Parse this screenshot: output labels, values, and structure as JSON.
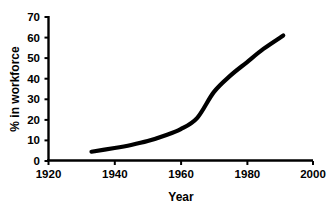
{
  "chart_data": {
    "type": "line",
    "title": "",
    "xlabel": "Year",
    "ylabel": "% in workforce",
    "xlim": [
      1920,
      2000
    ],
    "ylim": [
      0,
      70
    ],
    "xticks": [
      1920,
      1940,
      1960,
      1980,
      2000
    ],
    "yticks": [
      0,
      10,
      20,
      30,
      40,
      50,
      60,
      70
    ],
    "grid": false,
    "legend": false,
    "series": [
      {
        "name": "% in workforce",
        "color": "#000000",
        "x": [
          1933,
          1940,
          1945,
          1950,
          1955,
          1960,
          1965,
          1970,
          1975,
          1980,
          1985,
          1991
        ],
        "values": [
          4.5,
          6.3,
          7.8,
          9.7,
          12.3,
          15.5,
          21.0,
          33.5,
          41.5,
          48.0,
          54.5,
          61.0
        ]
      }
    ]
  },
  "axis": {
    "x_label": "Year",
    "y_label": "% in workforce",
    "x_tick_labels": [
      "1920",
      "1940",
      "1960",
      "1980",
      "2000"
    ],
    "y_tick_labels": [
      "0",
      "10",
      "20",
      "30",
      "40",
      "50",
      "60",
      "70"
    ]
  },
  "style": {
    "background": "#ffffff",
    "ink": "#000000",
    "curve_color": "#000000"
  }
}
